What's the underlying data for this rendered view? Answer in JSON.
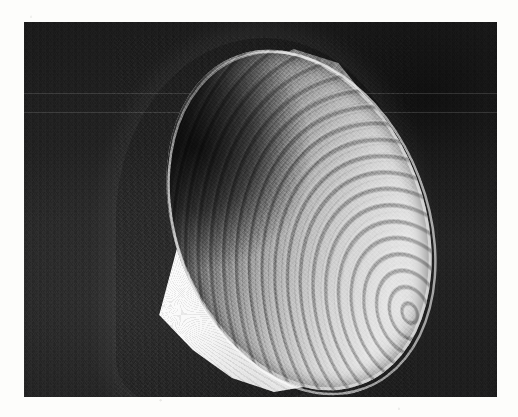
{
  "figure": {
    "kind": "rendered-3d-surface",
    "caption": "",
    "background": {
      "panel_color": "#252525",
      "page_color": "#fdfdfb",
      "texture": "scanned halftone noise"
    },
    "surface": {
      "highlight_color": "#f2f2f2",
      "midtone_color": "#9b9b9b",
      "shadow_color": "#2e2e2e",
      "rim_highlight_color": "#ffffff",
      "ribbing": "concentric corrugations along the cone axis"
    },
    "panel": {
      "x": 24,
      "y": 22,
      "width": 473,
      "height": 375
    },
    "geometry": {
      "apex_x": 128,
      "apex_y": 292,
      "rim_center_x": 300,
      "rim_center_y": 215,
      "rim_major_axis": 352,
      "rim_minor_axis": 250,
      "rim_rotation_deg": -21
    },
    "artifacts": {
      "scan_seam_rows": [
        93,
        112
      ],
      "has_page_margin": true
    }
  }
}
